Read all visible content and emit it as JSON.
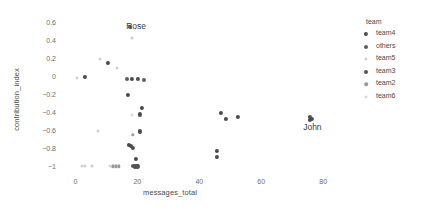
{
  "chart_data": {
    "type": "scatter",
    "title": "",
    "xlabel": "messages_total",
    "ylabel": "contribution_index",
    "xlim": [
      -4,
      88
    ],
    "ylim": [
      -1.08,
      0.66
    ],
    "xticks": [
      0,
      20,
      40,
      60,
      80
    ],
    "yticks": [
      0.6,
      0.4,
      0.2,
      0,
      -0.2,
      -0.4,
      -0.6,
      -0.8,
      -1
    ],
    "xtick_labels": [
      "0",
      "20",
      "40",
      "60",
      "80"
    ],
    "ytick_labels": [
      "0.6",
      "0.4",
      "0.2",
      "0",
      "−0.2",
      "−0.4",
      "−0.6",
      "−0.8",
      "−1"
    ],
    "grid": false,
    "legend_position": "right",
    "legend_title": "team",
    "series": [
      {
        "name": "team4",
        "color": "#4a4a4a",
        "points": [
          {
            "x": 3.0,
            "y": 0.0
          },
          {
            "x": 10.5,
            "y": 0.155
          },
          {
            "x": 18.3,
            "y": -0.02
          },
          {
            "x": 20.2,
            "y": -0.02
          },
          {
            "x": 17.0,
            "y": -0.195
          },
          {
            "x": 21.5,
            "y": -0.345
          },
          {
            "x": 20.8,
            "y": -0.415
          },
          {
            "x": 20.9,
            "y": -0.605
          },
          {
            "x": 17.2,
            "y": -0.755
          },
          {
            "x": 17.9,
            "y": -0.765
          },
          {
            "x": 18.6,
            "y": -0.785
          },
          {
            "x": 19.6,
            "y": -0.915
          },
          {
            "x": 19.2,
            "y": -0.995
          },
          {
            "x": 20.0,
            "y": -0.995
          },
          {
            "x": 47.0,
            "y": -0.395
          },
          {
            "x": 48.5,
            "y": -0.465
          },
          {
            "x": 52.5,
            "y": -0.445
          },
          {
            "x": 45.6,
            "y": -0.825
          },
          {
            "x": 45.6,
            "y": -0.885
          },
          {
            "x": 75.8,
            "y": -0.445
          },
          {
            "x": 75.8,
            "y": -0.475
          },
          {
            "x": 76.4,
            "y": -0.47
          }
        ]
      },
      {
        "name": "others",
        "color": "#5d5d5d",
        "points": [
          {
            "x": 17.6,
            "y": 0.555
          },
          {
            "x": 16.5,
            "y": -0.015
          },
          {
            "x": 22.0,
            "y": -0.035
          }
        ]
      },
      {
        "name": "team5",
        "color": "#cfcfcf",
        "points": [
          {
            "x": 18.2,
            "y": 0.435
          },
          {
            "x": 7.8,
            "y": 0.205
          },
          {
            "x": 13.5,
            "y": 0.105
          },
          {
            "x": 0.6,
            "y": -0.005
          },
          {
            "x": 7.2,
            "y": -0.595
          },
          {
            "x": 2.0,
            "y": -0.995
          },
          {
            "x": 3.2,
            "y": -0.995
          },
          {
            "x": 5.5,
            "y": -0.995
          }
        ]
      },
      {
        "name": "team3",
        "color": "#555555",
        "points": [
          {
            "x": 18.7,
            "y": -0.995
          },
          {
            "x": 19.9,
            "y": -0.995
          }
        ]
      },
      {
        "name": "team2",
        "color": "#9a9a9a",
        "points": [
          {
            "x": 18.5,
            "y": -0.645
          },
          {
            "x": 12.0,
            "y": -0.995
          },
          {
            "x": 13.0,
            "y": -0.995
          },
          {
            "x": 14.0,
            "y": -0.995
          }
        ]
      },
      {
        "name": "team6",
        "color": "#d8d8d8",
        "points": [
          {
            "x": 18.4,
            "y": -0.425
          },
          {
            "x": 11.2,
            "y": -0.995
          }
        ]
      }
    ],
    "annotations": [
      {
        "label": "Rose",
        "x": 19.6,
        "y": 0.575
      },
      {
        "label": "John",
        "x": 76.5,
        "y": -0.555
      }
    ],
    "legend_entries": [
      {
        "label": "team4",
        "color": "#4a4a4a",
        "size": 4.2
      },
      {
        "label": "others",
        "color": "#5d5d5d",
        "size": 4.0
      },
      {
        "label": "team5",
        "color": "#cfcfcf",
        "size": 3.2
      },
      {
        "label": "team3",
        "color": "#555555",
        "size": 4.0
      },
      {
        "label": "team2",
        "color": "#9a9a9a",
        "size": 3.6
      },
      {
        "label": "team6",
        "color": "#d8d8d8",
        "size": 3.2
      }
    ]
  }
}
